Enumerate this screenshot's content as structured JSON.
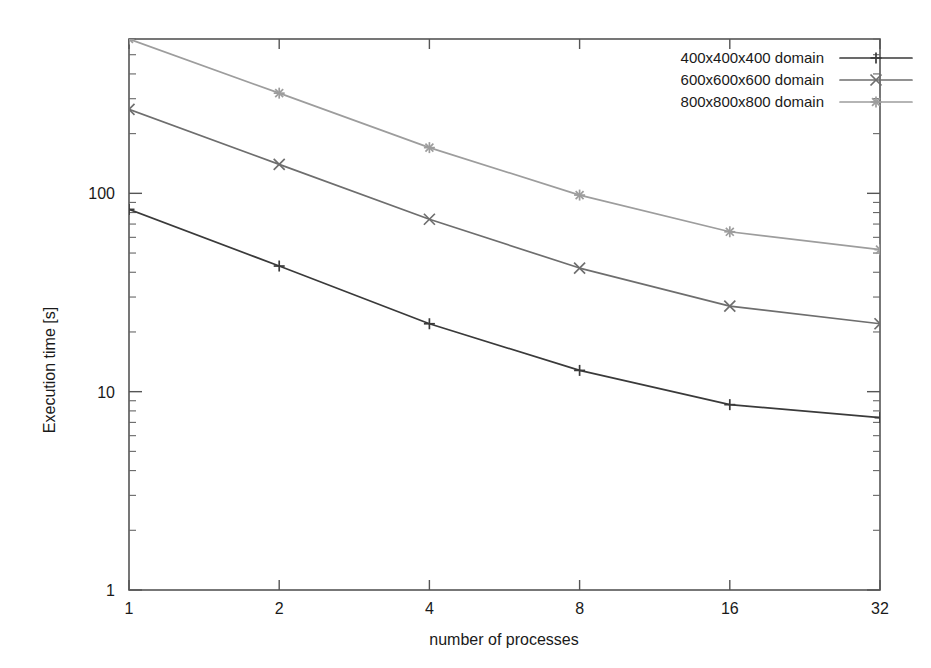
{
  "chart_data": {
    "type": "line",
    "title": "",
    "xlabel": "number of processes",
    "ylabel": "Execution time [s]",
    "xscale": "log2",
    "yscale": "log10",
    "xlim": [
      1,
      32
    ],
    "ylim": [
      1,
      600
    ],
    "grid": false,
    "legend_position": "top-right",
    "x_ticks": [
      "1",
      "2",
      "4",
      "8",
      "16",
      "32"
    ],
    "x_tick_values": [
      1,
      2,
      4,
      8,
      16,
      32
    ],
    "y_ticks": [
      "1",
      "10",
      "100"
    ],
    "y_tick_values": [
      1,
      10,
      100
    ],
    "x": [
      1,
      2,
      4,
      8,
      16,
      32
    ],
    "series": [
      {
        "name": "400x400x400 domain",
        "marker": "plus",
        "color": "#3a3a3a",
        "values": [
          83,
          43,
          22,
          12.8,
          8.6,
          7.4
        ]
      },
      {
        "name": "600x600x600 domain",
        "marker": "cross",
        "color": "#6e6e6e",
        "values": [
          265,
          140,
          74,
          42,
          27,
          22
        ]
      },
      {
        "name": "800x800x800 domain",
        "marker": "star",
        "color": "#9d9d9d",
        "values": [
          600,
          320,
          170,
          98,
          64,
          52
        ]
      }
    ]
  },
  "legend": {
    "entries": [
      {
        "label": "400x400x400 domain"
      },
      {
        "label": "600x600x600 domain"
      },
      {
        "label": "800x800x800 domain"
      }
    ]
  },
  "axes": {
    "x_title": "number of processes",
    "y_title": "Execution time [s]",
    "x_tick_labels": [
      "1",
      "2",
      "4",
      "8",
      "16",
      "32"
    ],
    "y_tick_labels": [
      "1",
      "10",
      "100"
    ]
  }
}
